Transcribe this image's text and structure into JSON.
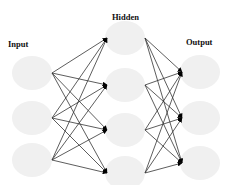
{
  "diagram": {
    "type": "neural-network",
    "layers": [
      {
        "name": "Input",
        "label": "Input",
        "label_x": 8,
        "label_y": 39,
        "nodes": [
          {
            "cx": 32,
            "cy": 73
          },
          {
            "cx": 32,
            "cy": 118
          },
          {
            "cx": 32,
            "cy": 160
          }
        ]
      },
      {
        "name": "Hidden",
        "label": "Hidden",
        "label_x": 112,
        "label_y": 12,
        "nodes": [
          {
            "cx": 125,
            "cy": 38
          },
          {
            "cx": 125,
            "cy": 85
          },
          {
            "cx": 125,
            "cy": 130
          },
          {
            "cx": 125,
            "cy": 173
          }
        ]
      },
      {
        "name": "Output",
        "label": "Output",
        "label_x": 186,
        "label_y": 37,
        "nodes": [
          {
            "cx": 200,
            "cy": 72
          },
          {
            "cx": 200,
            "cy": 118
          },
          {
            "cx": 200,
            "cy": 163
          }
        ]
      }
    ],
    "node_style": {
      "rx": 20,
      "ry": 17,
      "fill": "#f0f0f0"
    },
    "edge_style": {
      "stroke": "#333333",
      "arrow_fill": "#000000"
    },
    "connections": "fully-connected between adjacent layers"
  }
}
